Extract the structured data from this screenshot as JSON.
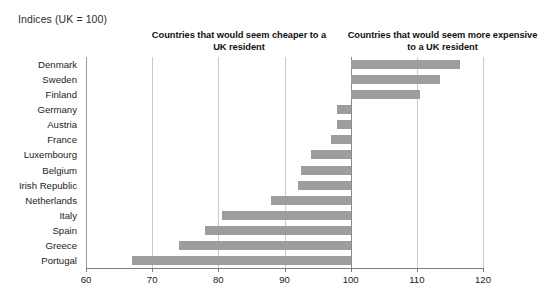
{
  "caption": "Indices (UK = 100)",
  "headers": {
    "cheaper": "Countries that would seem cheaper to a UK resident",
    "expensive": "Countries that would seem more expensive to a UK resident"
  },
  "colors": {
    "bar": "#9d9d9d",
    "gridline": "#c9c9c9",
    "axis": "#7d7d7d",
    "text": "#1c1c1c",
    "background": "#ffffff"
  },
  "chart_data": {
    "type": "bar",
    "orientation": "horizontal",
    "title": "Indices (UK = 100)",
    "xlabel": "",
    "ylabel": "",
    "baseline": 100,
    "xlim": [
      60,
      120
    ],
    "xticks": [
      60,
      70,
      80,
      90,
      100,
      110,
      120
    ],
    "xtick_labels": [
      "60",
      "70",
      "80",
      "90",
      "100",
      "110",
      "120"
    ],
    "grid": true,
    "legend": false,
    "annotations": [
      "Countries that would seem cheaper to a UK resident",
      "Countries that would seem more expensive to a UK resident"
    ],
    "categories": [
      "Denmark",
      "Sweden",
      "Finland",
      "Germany",
      "Austria",
      "France",
      "Luxembourg",
      "Belgium",
      "Irish Republic",
      "Netherlands",
      "Italy",
      "Spain",
      "Greece",
      "Portugal"
    ],
    "values": [
      116.5,
      113.5,
      110.5,
      98.0,
      98.0,
      97.0,
      94.0,
      92.5,
      92.0,
      88.0,
      80.5,
      78.0,
      74.0,
      67.0
    ]
  }
}
